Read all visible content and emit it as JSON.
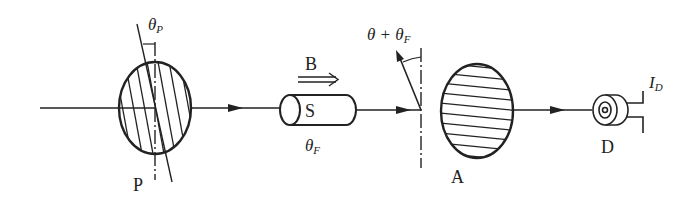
{
  "diagram": {
    "type": "optical-setup",
    "components": {
      "polarizer": {
        "label": "P",
        "angle_label": "θ",
        "angle_sub": "P"
      },
      "magnetic_field": {
        "label": "B"
      },
      "solenoid": {
        "label": "S",
        "angle_label": "θ",
        "angle_sub": "F"
      },
      "rotated_polarization": {
        "label_main": "θ + θ",
        "label_sub": "F"
      },
      "analyzer": {
        "label": "A"
      },
      "detector": {
        "label": "D",
        "current_label": "I",
        "current_sub": "D"
      }
    },
    "colors": {
      "stroke": "#222222",
      "background": "#ffffff"
    }
  }
}
